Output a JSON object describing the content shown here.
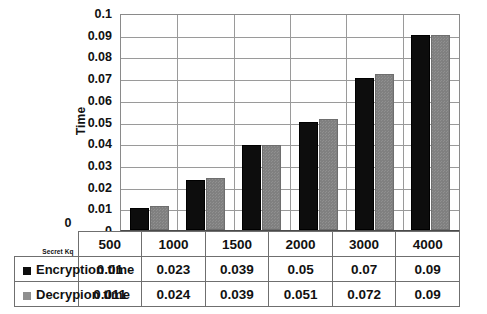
{
  "chart_data": {
    "type": "bar",
    "title": "",
    "xlabel": "Secret Kq",
    "ylabel": "Time",
    "categories": [
      "500",
      "1000",
      "1500",
      "2000",
      "3000",
      "4000"
    ],
    "series": [
      {
        "name": "Encryption time",
        "color": "#0d0d0d",
        "values": [
          0.01,
          0.023,
          0.039,
          0.05,
          0.07,
          0.09
        ]
      },
      {
        "name": "Decrypion time",
        "color": "#808080",
        "values": [
          0.011,
          0.024,
          0.039,
          0.051,
          0.072,
          0.09
        ]
      }
    ],
    "ylim": [
      0,
      0.1
    ],
    "ytick_labels": [
      "0.1",
      "0.09",
      "0.08",
      "0.07",
      "0.06",
      "0.05",
      "0.04",
      "0.03",
      "0.02",
      "0.01",
      "0"
    ],
    "ytick_values": [
      0.1,
      0.09,
      0.08,
      0.07,
      0.06,
      0.05,
      0.04,
      0.03,
      0.02,
      0.01,
      0
    ],
    "grid": true,
    "legend": "data-table",
    "data_table": {
      "header_corner": "Secret Kq",
      "columns": [
        "500",
        "1000",
        "1500",
        "2000",
        "3000",
        "4000"
      ],
      "rows": [
        {
          "label": "Encryption time",
          "swatch": "black-square-icon",
          "cells": [
            "0.01",
            "0.023",
            "0.039",
            "0.05",
            "0.07",
            "0.09"
          ]
        },
        {
          "label": "Decrypion time",
          "swatch": "gray-square-icon",
          "cells": [
            "0.011",
            "0.024",
            "0.039",
            "0.051",
            "0.072",
            "0.09"
          ]
        }
      ]
    }
  }
}
